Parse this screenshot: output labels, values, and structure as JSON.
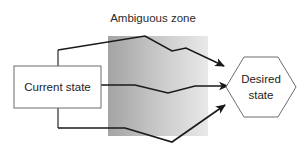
{
  "diagram": {
    "title": "Ambiguous zone",
    "zone": {
      "label": "Ambiguous zone",
      "fill_left": "#a8a8a8",
      "fill_right": "#e8e8e8",
      "x": 108,
      "y": 36,
      "width": 100,
      "height": 100
    },
    "nodes": [
      {
        "id": "current-state",
        "shape": "rectangle",
        "label": "Current state",
        "x": 14,
        "y": 66,
        "width": 87,
        "height": 42,
        "stroke": "#6d6d6d",
        "fill": "#ffffff"
      },
      {
        "id": "desired-state",
        "shape": "hexagon",
        "label_line1": "Desired",
        "label_line2": "state",
        "x": 226,
        "y": 57,
        "width": 70,
        "height": 60,
        "stroke": "#6d6d6d",
        "fill": "#ffffff"
      }
    ],
    "paths": [
      {
        "id": "upper-path",
        "name": "upper-zigzag-arrow",
        "description": "rises from current state, peaks inside the ambiguous zone, zigzags down to desired state",
        "points": "58,50 145,36 172,51 186,48 228,70",
        "arrow_tip": [
          228,
          70
        ],
        "stroke": "#1a1a1a"
      },
      {
        "id": "middle-path",
        "name": "middle-arrow",
        "description": "straight from current state, slight dip inside the ambiguous zone, into desired state",
        "points": "101,85 135,85 168,93 195,86 232,86",
        "arrow_tip": [
          232,
          86
        ],
        "stroke": "#1a1a1a"
      },
      {
        "id": "lower-path",
        "name": "lower-zigzag-arrow",
        "description": "drops below current state, dips to lowest point in the ambiguous zone, climbs to desired state",
        "points": "58,128 125,128 172,142 228,102",
        "arrow_tip": [
          228,
          102
        ],
        "stroke": "#1a1a1a"
      }
    ],
    "connectors": [
      {
        "id": "connector-top",
        "name": "current-state-to-upper-path-riser",
        "points": "58,66 58,50"
      },
      {
        "id": "connector-bottom",
        "name": "current-state-to-lower-path-riser",
        "points": "58,108 58,128"
      }
    ],
    "colors": {
      "line": "#1a1a1a",
      "shape_stroke": "#6d6d6d",
      "text": "#1c1c1c",
      "title_text": "#2b2b2b",
      "background": "#ffffff"
    }
  }
}
